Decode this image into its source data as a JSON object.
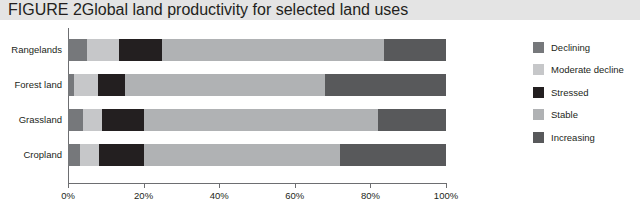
{
  "header": {
    "figure_number": "FIGURE 2",
    "title": "Global land productivity for selected land uses"
  },
  "chart_data": {
    "type": "bar",
    "orientation": "horizontal",
    "stacked": true,
    "normalized": true,
    "title": "Global land productivity for selected land uses",
    "xlabel": "",
    "ylabel": "",
    "xlim": [
      0,
      100
    ],
    "xticks": [
      0,
      20,
      40,
      60,
      80,
      100
    ],
    "xtick_labels": [
      "0%",
      "20%",
      "40%",
      "60%",
      "80%",
      "100%"
    ],
    "grid": false,
    "legend_position": "right",
    "categories": [
      "Rangelands",
      "Forest land",
      "Grassland",
      "Cropland"
    ],
    "series": [
      {
        "name": "Declining",
        "color": "#76787b",
        "values": [
          5.0,
          1.6,
          4.0,
          3.2
        ]
      },
      {
        "name": "Moderate decline",
        "color": "#c6c7c9",
        "values": [
          8.5,
          6.4,
          5.0,
          5.0
        ]
      },
      {
        "name": "Stressed",
        "color": "#231f20",
        "values": [
          11.5,
          7.0,
          11.0,
          11.8
        ]
      },
      {
        "name": "Stable",
        "color": "#b0b2b4",
        "values": [
          58.5,
          53.0,
          62.0,
          52.0
        ]
      },
      {
        "name": "Increasing",
        "color": "#58595b",
        "values": [
          16.5,
          32.0,
          18.0,
          28.0
        ]
      }
    ]
  }
}
